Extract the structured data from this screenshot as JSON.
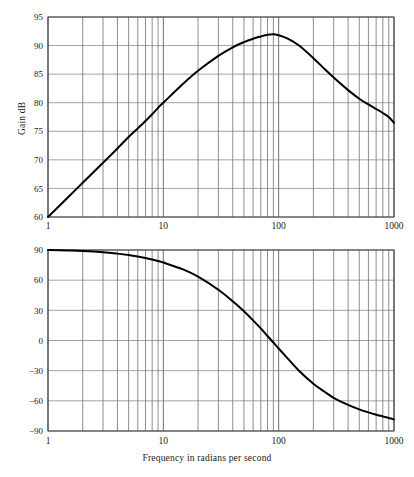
{
  "figure": {
    "background_color": "#ffffff",
    "curve_color": "#000000",
    "grid_color": "#5d5d5d",
    "frame_color": "#3a3a3a"
  },
  "gain_panel": {
    "y_axis_title": "Gain dB",
    "y_ticks": [
      "60",
      "65",
      "70",
      "75",
      "80",
      "85",
      "90",
      "95"
    ],
    "x_ticks": [
      "1",
      "10",
      "100",
      "1000"
    ]
  },
  "phase_panel": {
    "y_axis_title": "Phase in degrees",
    "y_ticks": [
      "-90",
      "-60",
      "-30",
      "0",
      "30",
      "60",
      "90"
    ],
    "x_ticks": [
      "1",
      "10",
      "100",
      "1000"
    ],
    "x_axis_title": "Frequency in radians per second"
  },
  "chart_data": [
    {
      "type": "line",
      "title": "",
      "xlabel": "",
      "ylabel": "Gain dB",
      "xscale": "log",
      "xlim": [
        1,
        1000
      ],
      "ylim": [
        60,
        95
      ],
      "yticks": [
        60,
        65,
        70,
        75,
        80,
        85,
        90,
        95
      ],
      "xticks": [
        1,
        10,
        100,
        1000
      ],
      "grid": true,
      "legend": "none",
      "x": [
        1,
        1.5,
        2,
        3,
        4,
        5,
        6,
        7,
        8,
        9,
        10,
        15,
        20,
        30,
        40,
        50,
        60,
        70,
        80,
        90,
        100,
        120,
        150,
        200,
        250,
        300,
        400,
        500,
        600,
        700,
        800,
        900,
        1000
      ],
      "y": [
        60.0,
        63.5,
        66.0,
        69.5,
        72.0,
        74.0,
        75.5,
        76.8,
        78.0,
        79.1,
        80.0,
        83.4,
        85.6,
        88.2,
        89.7,
        90.6,
        91.2,
        91.6,
        91.9,
        92.0,
        91.8,
        91.2,
        90.0,
        87.8,
        85.9,
        84.4,
        82.2,
        80.7,
        79.7,
        78.9,
        78.2,
        77.5,
        76.5
      ]
    },
    {
      "type": "line",
      "title": "",
      "xlabel": "Frequency in radians per second",
      "ylabel": "Phase in degrees",
      "xscale": "log",
      "xlim": [
        1,
        1000
      ],
      "ylim": [
        -90,
        90
      ],
      "yticks": [
        -90,
        -60,
        -30,
        0,
        30,
        60,
        90
      ],
      "xticks": [
        1,
        10,
        100,
        1000
      ],
      "grid": true,
      "legend": "none",
      "x": [
        1,
        1.5,
        2,
        3,
        4,
        5,
        6,
        7,
        8,
        9,
        10,
        15,
        20,
        30,
        40,
        50,
        60,
        70,
        80,
        90,
        100,
        120,
        150,
        200,
        250,
        300,
        400,
        500,
        600,
        700,
        800,
        900,
        1000
      ],
      "y": [
        90.0,
        89.5,
        89.0,
        87.8,
        86.4,
        85.0,
        83.5,
        82.0,
        80.5,
        79.0,
        77.5,
        70.5,
        63.5,
        50.5,
        39.0,
        29.0,
        20.0,
        12.0,
        4.5,
        -2.0,
        -8.0,
        -18.0,
        -30.0,
        -43.0,
        -51.0,
        -57.0,
        -64.0,
        -68.5,
        -71.5,
        -73.8,
        -75.5,
        -77.0,
        -78.5
      ]
    }
  ]
}
